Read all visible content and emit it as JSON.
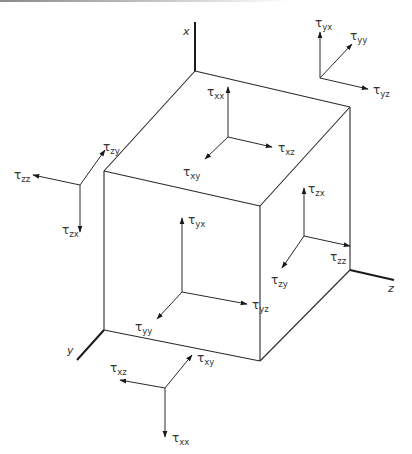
{
  "diagram": {
    "axes": [
      {
        "id": "x",
        "label": "x"
      },
      {
        "id": "y",
        "label": "y"
      },
      {
        "id": "z",
        "label": "z"
      }
    ],
    "symbol": "τ",
    "groups": [
      {
        "id": "top-face",
        "components": [
          "xx",
          "xz",
          "xy"
        ]
      },
      {
        "id": "front-face",
        "components": [
          "yx",
          "yz",
          "yy"
        ]
      },
      {
        "id": "right-face",
        "components": [
          "zx",
          "zz",
          "zy"
        ]
      },
      {
        "id": "left-outside",
        "components": [
          "zy",
          "zz",
          "zx"
        ]
      },
      {
        "id": "top-right-outside",
        "components": [
          "yx",
          "yy",
          "yz"
        ]
      },
      {
        "id": "bottom-outside",
        "components": [
          "xy",
          "xz",
          "xx"
        ]
      }
    ]
  }
}
